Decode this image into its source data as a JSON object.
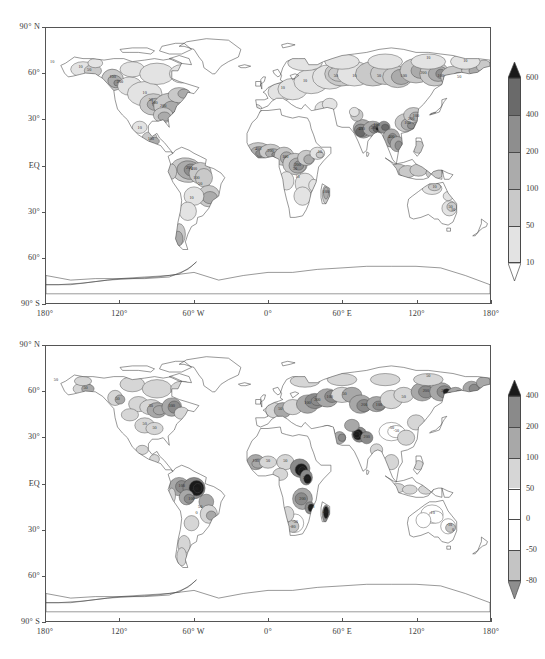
{
  "figure": {
    "width": 545,
    "height": 659,
    "background": "#ffffff",
    "caption": ""
  },
  "panels": [
    {
      "id": "panel-top",
      "name": "precipitation-map-top",
      "frame": {
        "left": 45,
        "top": 27,
        "width": 446,
        "height": 277
      },
      "yaxis": {
        "label": "",
        "ticks": [
          {
            "value": 90,
            "text": "90° N"
          },
          {
            "value": 60,
            "text": "60°"
          },
          {
            "value": 30,
            "text": "30°"
          },
          {
            "value": 0,
            "text": "EQ"
          },
          {
            "value": -30,
            "text": "30°"
          },
          {
            "value": -60,
            "text": "60°"
          },
          {
            "value": -90,
            "text": "90° S"
          }
        ],
        "range": [
          -90,
          90
        ]
      },
      "xaxis": {
        "label": "",
        "ticks": [
          {
            "value": -180,
            "text": "180°"
          },
          {
            "value": -120,
            "text": "120°"
          },
          {
            "value": -60,
            "text": "60° W"
          },
          {
            "value": 0,
            "text": "0°"
          },
          {
            "value": 60,
            "text": "60° E"
          },
          {
            "value": 120,
            "text": "120°"
          },
          {
            "value": 180,
            "text": "180°"
          }
        ],
        "range": [
          -180,
          180
        ]
      },
      "colorbar": {
        "name": "colorbar-top",
        "orientation": "vertical",
        "extend": "both",
        "levels": [
          10,
          50,
          100,
          200,
          400,
          600
        ],
        "tick_labels": [
          "600",
          "400",
          "200",
          "100",
          "50",
          "10"
        ],
        "colors": [
          "#ffffff",
          "#e3e3e3",
          "#c9c9c9",
          "#ababab",
          "#8e8e8e",
          "#6a6a6a",
          "#1a1a1a"
        ],
        "box": {
          "left": 508,
          "top": 78,
          "width": 13,
          "height": 185
        },
        "label_x": 526
      },
      "contour_labels": [
        "10",
        "50",
        "100",
        "200",
        "400"
      ]
    },
    {
      "id": "panel-bottom",
      "name": "precipitation-map-bottom",
      "frame": {
        "left": 45,
        "top": 345,
        "width": 446,
        "height": 277
      },
      "yaxis": {
        "label": "",
        "ticks": [
          {
            "value": 90,
            "text": "90° N"
          },
          {
            "value": 60,
            "text": "60°"
          },
          {
            "value": 30,
            "text": "30°"
          },
          {
            "value": 0,
            "text": "EQ"
          },
          {
            "value": -30,
            "text": "30°"
          },
          {
            "value": -60,
            "text": "60°"
          },
          {
            "value": -90,
            "text": "90° S"
          }
        ],
        "range": [
          -90,
          90
        ]
      },
      "xaxis": {
        "label": "",
        "ticks": [
          {
            "value": -180,
            "text": "180°"
          },
          {
            "value": -120,
            "text": "120°"
          },
          {
            "value": -60,
            "text": "60° W"
          },
          {
            "value": 0,
            "text": "0°"
          },
          {
            "value": 60,
            "text": "60° E"
          },
          {
            "value": 120,
            "text": "120°"
          },
          {
            "value": 180,
            "text": "180°"
          }
        ],
        "range": [
          -180,
          180
        ]
      },
      "colorbar": {
        "name": "colorbar-bottom",
        "orientation": "vertical",
        "extend": "both",
        "levels": [
          -80,
          -50,
          0,
          50,
          100,
          200,
          400
        ],
        "tick_labels": [
          "400",
          "200",
          "100",
          "50",
          "0",
          "-50",
          "-80"
        ],
        "colors": [
          "#8e8e8e",
          "#c4c4c4",
          "#ffffff",
          "#ffffff",
          "#d6d6d6",
          "#a8a8a8",
          "#8a8a8a",
          "#1a1a1a"
        ],
        "box": {
          "left": 508,
          "top": 396,
          "width": 13,
          "height": 185
        },
        "label_x": 526
      },
      "contour_labels": [
        "-80",
        "-50",
        "0",
        "50",
        "100",
        "200",
        "400"
      ]
    }
  ],
  "chart_data": {
    "type": "heatmap",
    "title": "",
    "subtitle": "",
    "xlabel": "",
    "ylabel": "",
    "projection": "cylindrical-equidistant",
    "grid": false,
    "legend_position": "right",
    "xlim": [
      -180,
      180
    ],
    "ylim": [
      -90,
      90
    ],
    "maps": [
      {
        "name": "panel-top",
        "description": "Global filled-contour field, positive values only",
        "contour_levels": [
          10,
          50,
          100,
          200,
          400,
          600
        ],
        "colorbar_ticks": [
          10,
          50,
          100,
          200,
          400,
          600
        ],
        "shade_colors": [
          "#ffffff",
          "#e3e3e3",
          "#c9c9c9",
          "#ababab",
          "#8e8e8e",
          "#6a6a6a",
          "#1a1a1a"
        ],
        "regional_values": [
          {
            "region": "Alaska / NW Canada",
            "lon": -150,
            "lat": 63,
            "value": 50
          },
          {
            "region": "Western Canada",
            "lon": -120,
            "lat": 55,
            "value": 200
          },
          {
            "region": "Central USA",
            "lon": -95,
            "lat": 40,
            "value": 100
          },
          {
            "region": "Eastern USA",
            "lon": -80,
            "lat": 38,
            "value": 200
          },
          {
            "region": "Mexico",
            "lon": -102,
            "lat": 24,
            "value": 10
          },
          {
            "region": "Amazon Basin",
            "lon": -62,
            "lat": -4,
            "value": 400
          },
          {
            "region": "Brazil southeast",
            "lon": -48,
            "lat": -20,
            "value": 100
          },
          {
            "region": "Patagonia",
            "lon": -70,
            "lat": -45,
            "value": 50
          },
          {
            "region": "Sahel / West Africa",
            "lon": -5,
            "lat": 12,
            "value": 400
          },
          {
            "region": "Congo Basin",
            "lon": 20,
            "lat": 0,
            "value": 200
          },
          {
            "region": "Horn of Africa",
            "lon": 42,
            "lat": 8,
            "value": 100
          },
          {
            "region": "Southern Africa",
            "lon": 28,
            "lat": -22,
            "value": 50
          },
          {
            "region": "Madagascar",
            "lon": 47,
            "lat": -19,
            "value": 100
          },
          {
            "region": "Europe",
            "lon": 15,
            "lat": 50,
            "value": 50
          },
          {
            "region": "West Siberia",
            "lon": 70,
            "lat": 60,
            "value": 100
          },
          {
            "region": "East Siberia",
            "lon": 130,
            "lat": 62,
            "value": 200
          },
          {
            "region": "India / Monsoon",
            "lon": 80,
            "lat": 22,
            "value": 600
          },
          {
            "region": "Southeast Asia",
            "lon": 102,
            "lat": 16,
            "value": 400
          },
          {
            "region": "Eastern China",
            "lon": 115,
            "lat": 30,
            "value": 200
          },
          {
            "region": "Kamchatka / Far East",
            "lon": 155,
            "lat": 58,
            "value": 200
          },
          {
            "region": "Northern Australia",
            "lon": 132,
            "lat": -16,
            "value": 50
          },
          {
            "region": "Eastern Australia",
            "lon": 150,
            "lat": -30,
            "value": 50
          },
          {
            "region": "Antarctica",
            "lon": 0,
            "lat": -80,
            "value": 0
          },
          {
            "region": "Oceans",
            "lon": 0,
            "lat": 0,
            "value": null
          }
        ]
      },
      {
        "name": "panel-bottom",
        "description": "Global filled-contour difference/anomaly field with negative and positive values",
        "contour_levels": [
          -80,
          -50,
          0,
          50,
          100,
          200,
          400
        ],
        "colorbar_ticks": [
          -80,
          -50,
          0,
          50,
          100,
          200,
          400
        ],
        "shade_colors": [
          "#8e8e8e",
          "#c4c4c4",
          "#ffffff",
          "#ffffff",
          "#d6d6d6",
          "#a8a8a8",
          "#8a8a8a",
          "#1a1a1a"
        ],
        "regional_values": [
          {
            "region": "Alaska",
            "lon": -150,
            "lat": 62,
            "value": 50
          },
          {
            "region": "Western Canada",
            "lon": -120,
            "lat": 55,
            "value": 50
          },
          {
            "region": "Eastern Canada",
            "lon": -78,
            "lat": 52,
            "value": 100
          },
          {
            "region": "Central USA",
            "lon": -95,
            "lat": 38,
            "value": 0
          },
          {
            "region": "Northwestern Amazon",
            "lon": -70,
            "lat": -2,
            "value": 200
          },
          {
            "region": "Central Amazon",
            "lon": -58,
            "lat": -3,
            "value": 400
          },
          {
            "region": "Brazil southeast",
            "lon": -48,
            "lat": -18,
            "value": 50
          },
          {
            "region": "Argentina",
            "lon": -64,
            "lat": -34,
            "value": 0
          },
          {
            "region": "West Africa",
            "lon": -8,
            "lat": 12,
            "value": 100
          },
          {
            "region": "Central Africa / Sudan",
            "lon": 28,
            "lat": 8,
            "value": 400
          },
          {
            "region": "Congo / Zambia",
            "lon": 26,
            "lat": -12,
            "value": 200
          },
          {
            "region": "Southern Africa",
            "lon": 24,
            "lat": -26,
            "value": -50
          },
          {
            "region": "Madagascar",
            "lon": 47,
            "lat": -20,
            "value": 400
          },
          {
            "region": "Europe",
            "lon": 12,
            "lat": 48,
            "value": 50
          },
          {
            "region": "Eastern Europe / Russia",
            "lon": 40,
            "lat": 54,
            "value": 200
          },
          {
            "region": "Central Asia",
            "lon": 70,
            "lat": 45,
            "value": 100
          },
          {
            "region": "Himalaya / N India",
            "lon": 78,
            "lat": 32,
            "value": 400
          },
          {
            "region": "Central China",
            "lon": 105,
            "lat": 34,
            "value": -50
          },
          {
            "region": "Southeast Asia",
            "lon": 104,
            "lat": 14,
            "value": 0
          },
          {
            "region": "Far East Russia",
            "lon": 150,
            "lat": 60,
            "value": 200
          },
          {
            "region": "Northern Australia",
            "lon": 133,
            "lat": -18,
            "value": -10
          },
          {
            "region": "Eastern Australia",
            "lon": 147,
            "lat": -28,
            "value": -10
          },
          {
            "region": "Antarctica",
            "lon": 0,
            "lat": -80,
            "value": 0
          }
        ]
      }
    ]
  }
}
